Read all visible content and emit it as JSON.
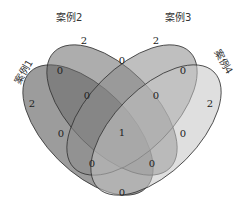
{
  "diagram": {
    "type": "venn-4",
    "sets": [
      {
        "name": "案例1",
        "color": "#5a5a5a"
      },
      {
        "name": "案例2",
        "color": "#6e6e6e"
      },
      {
        "name": "案例3",
        "color": "#8a8a8a"
      },
      {
        "name": "案例4",
        "color": "#b5b5b5"
      }
    ],
    "regions": {
      "only_1": "2",
      "only_2": "2",
      "only_3": "2",
      "only_4": "2",
      "1_2": "0",
      "2_3": "0",
      "3_4": "0",
      "1_3": "0",
      "2_4": "0",
      "1_2_3": "0",
      "2_3_4": "0",
      "1_2_4": "0",
      "1_3_4": "0",
      "1_4": "0",
      "all": "1"
    }
  }
}
